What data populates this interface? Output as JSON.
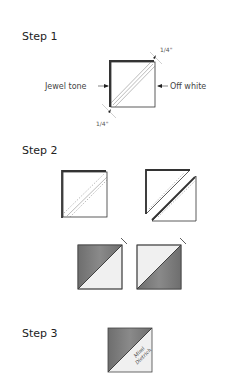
{
  "steps": [
    {
      "label": "Step 1"
    },
    {
      "label": "Step 2"
    },
    {
      "label": "Step 3"
    }
  ],
  "step1": {
    "left_label": "Jewel tone",
    "right_label": "Off white",
    "seam_top": "1/4\"",
    "seam_bottom": "1/4\""
  },
  "step3": {
    "signature": "Mimi Dietrich"
  },
  "colors": {
    "jewel": "#7a7a7a",
    "off_white": "#f0f0f0",
    "line": "#333333"
  }
}
